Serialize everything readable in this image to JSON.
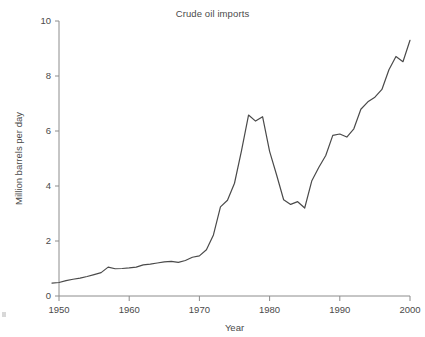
{
  "chart_data": {
    "type": "line",
    "title": "Crude oil imports",
    "xlabel": "Year",
    "ylabel": "Million barrels per day",
    "xlim": [
      1948.5,
      2000.5
    ],
    "ylim": [
      0,
      10
    ],
    "grid": false,
    "legend": null,
    "xticks": [
      1950,
      1960,
      1970,
      1980,
      1990,
      2000
    ],
    "xtick_labels": [
      "1950",
      "1960",
      "1970",
      "1980",
      "1990",
      "2000"
    ],
    "yticks": [
      0,
      2,
      4,
      6,
      8,
      10
    ],
    "ytick_labels": [
      "0",
      "2",
      "4",
      "6",
      "8",
      "10"
    ],
    "line_color": "#4a4a4a",
    "line_width": 1.2,
    "series": [
      {
        "name": "Crude oil imports",
        "x": [
          1949,
          1950,
          1951,
          1952,
          1953,
          1954,
          1955,
          1956,
          1957,
          1958,
          1959,
          1960,
          1961,
          1962,
          1963,
          1964,
          1965,
          1966,
          1967,
          1968,
          1969,
          1970,
          1971,
          1972,
          1973,
          1974,
          1975,
          1976,
          1977,
          1978,
          1979,
          1980,
          1981,
          1982,
          1983,
          1984,
          1985,
          1986,
          1987,
          1988,
          1989,
          1990,
          1991,
          1992,
          1993,
          1994,
          1995,
          1996,
          1997,
          1998,
          1999,
          2000
        ],
        "y": [
          0.47,
          0.49,
          0.56,
          0.61,
          0.65,
          0.71,
          0.78,
          0.85,
          1.05,
          0.99,
          1.0,
          1.02,
          1.05,
          1.13,
          1.16,
          1.2,
          1.24,
          1.26,
          1.22,
          1.29,
          1.41,
          1.46,
          1.68,
          2.22,
          3.24,
          3.48,
          4.1,
          5.29,
          6.58,
          6.36,
          6.52,
          5.26,
          4.4,
          3.5,
          3.33,
          3.43,
          3.2,
          4.18,
          4.67,
          5.11,
          5.84,
          5.89,
          5.78,
          6.08,
          6.79,
          7.06,
          7.23,
          7.51,
          8.23,
          8.71,
          8.52,
          9.3
        ],
        "unit": "million barrels per day"
      }
    ],
    "annotations": [
      {
        "label": "peak",
        "x": 1977,
        "y": 6.58
      },
      {
        "label": "trough",
        "x": 1983,
        "y": 3.33
      },
      {
        "label": "end",
        "x": 2000,
        "y": 9.3
      },
      {
        "label": "start",
        "x": 1949,
        "y": 0.47
      }
    ]
  }
}
